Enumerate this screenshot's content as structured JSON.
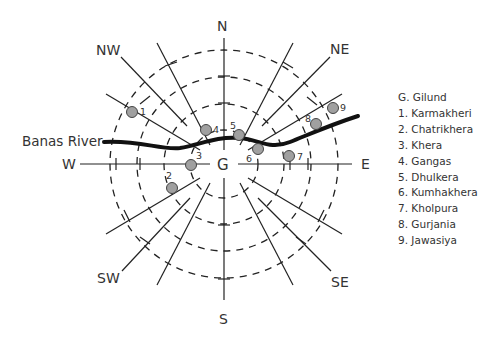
{
  "diagram": {
    "center_label": "G",
    "directions": {
      "N": "N",
      "NE": "NE",
      "E": "E",
      "SE": "SE",
      "S": "S",
      "SW": "SW",
      "W": "W",
      "NW": "NW"
    },
    "river_label": "Banas River",
    "site_markers": [
      {
        "id": "1",
        "label": "1"
      },
      {
        "id": "2",
        "label": "2"
      },
      {
        "id": "3",
        "label": "3"
      },
      {
        "id": "4",
        "label": "4"
      },
      {
        "id": "5",
        "label": "5"
      },
      {
        "id": "6",
        "label": "6"
      },
      {
        "id": "7",
        "label": "7"
      },
      {
        "id": "8",
        "label": "8"
      },
      {
        "id": "9",
        "label": "9"
      }
    ],
    "colors": {
      "line": "#222222",
      "river": "#111111",
      "marker_fill": "#a0a0a0",
      "marker_stroke": "#444444",
      "text": "#333333"
    }
  },
  "legend": {
    "items": [
      "G. Gilund",
      "1.  Karmakheri",
      "2.  Chatrikhera",
      "3.  Khera",
      "4.  Gangas",
      "5.  Dhulkera",
      "6.  Kumhakhera",
      "7.  Kholpura",
      "8.  Gurjania",
      "9. Jawasiya"
    ]
  }
}
